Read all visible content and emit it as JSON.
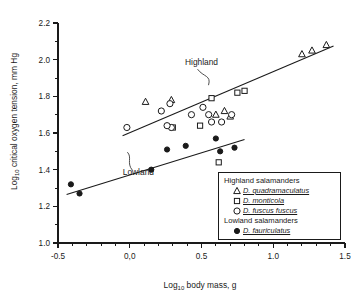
{
  "chart_data": {
    "type": "scatter",
    "title": "",
    "xlabel": "Log10 body mass, g",
    "ylabel": "Log10 critical oxygen tension, mm Hg",
    "xlim": [
      -0.5,
      1.5
    ],
    "ylim": [
      1.0,
      2.2
    ],
    "xticks": [
      -0.5,
      0.0,
      0.5,
      1.0,
      1.5
    ],
    "xticklabels": [
      "-0.5",
      "0,0",
      "0.5",
      "1.0",
      "1.5"
    ],
    "yticks": [
      1.0,
      1.2,
      1.4,
      1.6,
      1.8,
      2.0,
      2.2
    ],
    "yticklabels": [
      "1.0",
      "1.2",
      "1.4",
      "1.6",
      "1.8",
      "2.0",
      "2.2"
    ],
    "x_minor_interval": 0.1,
    "y_minor_interval": 0.1,
    "grid": false,
    "legend_position": "bottom-right",
    "series": [
      {
        "name": "D. quadramaculatus",
        "group": "Highland salamanders",
        "marker": "open-triangle",
        "points": [
          [
            0.11,
            1.77
          ],
          [
            0.29,
            1.78
          ],
          [
            0.6,
            1.7
          ],
          [
            0.66,
            1.72
          ],
          [
            0.7,
            1.69
          ],
          [
            1.2,
            2.03
          ],
          [
            1.27,
            2.05
          ],
          [
            1.37,
            2.08
          ]
        ]
      },
      {
        "name": "D. monticola",
        "group": "Highland salamanders",
        "marker": "open-square",
        "points": [
          [
            0.3,
            1.63
          ],
          [
            0.49,
            1.64
          ],
          [
            0.57,
            1.79
          ],
          [
            0.75,
            1.82
          ],
          [
            0.8,
            1.83
          ],
          [
            0.62,
            1.44
          ]
        ]
      },
      {
        "name": "D. fuscus fuscus",
        "group": "Highland salamanders",
        "marker": "open-circle",
        "points": [
          [
            -0.02,
            1.63
          ],
          [
            0.22,
            1.72
          ],
          [
            0.28,
            1.76
          ],
          [
            0.29,
            1.63
          ],
          [
            0.43,
            1.7
          ],
          [
            0.55,
            1.7
          ],
          [
            0.57,
            1.66
          ],
          [
            0.64,
            1.66
          ],
          [
            0.71,
            1.7
          ],
          [
            0.26,
            1.64
          ],
          [
            0.51,
            1.74
          ]
        ]
      },
      {
        "name": "D. fauriculatus",
        "group": "Lowland salamanders",
        "marker": "filled-circle",
        "points": [
          [
            -0.41,
            1.32
          ],
          [
            -0.35,
            1.27
          ],
          [
            0.15,
            1.4
          ],
          [
            0.26,
            1.51
          ],
          [
            0.39,
            1.53
          ],
          [
            0.6,
            1.57
          ],
          [
            0.63,
            1.5
          ],
          [
            0.73,
            1.52
          ]
        ]
      }
    ],
    "fit_lines": [
      {
        "label": "Highland",
        "x": [
          -0.05,
          1.42
        ],
        "y": [
          1.585,
          2.075
        ]
      },
      {
        "label": "Lowland",
        "x": [
          -0.44,
          0.8
        ],
        "y": [
          1.265,
          1.565
        ]
      }
    ],
    "annotations": [
      {
        "text": "Highland",
        "x": 0.5,
        "y": 1.97
      },
      {
        "text": "Lowland",
        "x": 0.06,
        "y": 1.37
      }
    ]
  },
  "axes": {
    "y_title_main": "Log",
    "y_title_sub": "10",
    "y_title_rest": " critical oxygen tension, mm Hg",
    "x_title_main": "Log",
    "x_title_sub": "10",
    "x_title_rest": " body mass, g"
  },
  "legend": {
    "groups": [
      {
        "title": "Highland salamanders",
        "entries": [
          {
            "symbol": "open-triangle",
            "name": "D. quadramaculatus"
          },
          {
            "symbol": "open-square",
            "name": "D. monticola"
          },
          {
            "symbol": "open-circle",
            "name": "D. fuscus fuscus"
          }
        ]
      },
      {
        "title": "Lowland salamanders",
        "entries": [
          {
            "symbol": "filled-circle",
            "name": "D. fauriculatus"
          }
        ]
      }
    ]
  },
  "colors": {
    "ink": "#1a1a1a",
    "background": "#ffffff"
  }
}
